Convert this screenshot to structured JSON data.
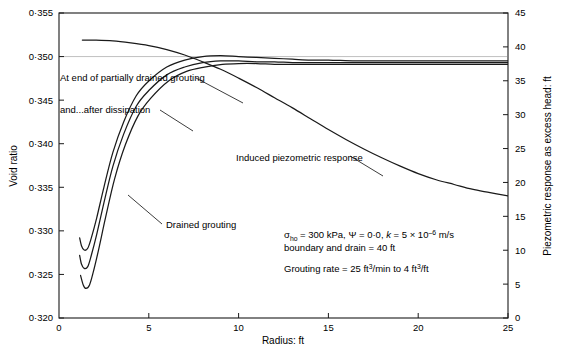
{
  "chart_data": {
    "type": "line",
    "title": "",
    "xlabel": "Radius: ft",
    "ylabel": "Void ratio",
    "y2label": "Piezometric response as excess head: ft",
    "xlim": [
      0,
      25
    ],
    "ylim": [
      0.32,
      0.355
    ],
    "y2lim": [
      0,
      45
    ],
    "grid": false,
    "legend": "none (curves labelled with leader lines)",
    "xticks": [
      "0",
      "5",
      "10",
      "15",
      "20",
      "25"
    ],
    "xtick_values": [
      0,
      5,
      10,
      15,
      20,
      25
    ],
    "yticks": [
      "0·320",
      "0·325",
      "0·330",
      "0·335",
      "0·340",
      "0·345",
      "0·350",
      "0·355"
    ],
    "ytick_values": [
      0.32,
      0.325,
      0.33,
      0.335,
      0.34,
      0.345,
      0.35,
      0.355
    ],
    "y2ticks": [
      "0",
      "5",
      "10",
      "15",
      "20",
      "25",
      "30",
      "35",
      "40",
      "45"
    ],
    "y2tick_values": [
      0,
      5,
      10,
      15,
      20,
      25,
      30,
      35,
      40,
      45
    ],
    "reference_line": {
      "axis": "y",
      "value": 0.35,
      "style": "faint grey horizontal"
    },
    "series": [
      {
        "name": "At end of partially drained grouting",
        "axis": "left",
        "x": [
          1.15,
          1.25,
          1.4,
          1.6,
          1.8,
          2.1,
          2.5,
          3.0,
          3.6,
          4.3,
          5.0,
          6.0,
          7.0,
          8.0,
          9.0,
          10.0,
          11.0,
          12.0,
          13.0,
          14.0,
          15.0,
          16.5,
          18.0,
          20.0,
          22.0,
          25.0
        ],
        "y": [
          0.3292,
          0.3283,
          0.3278,
          0.328,
          0.3292,
          0.3315,
          0.335,
          0.339,
          0.3425,
          0.3455,
          0.3472,
          0.3488,
          0.3496,
          0.35,
          0.3501,
          0.35,
          0.3499,
          0.3498,
          0.3497,
          0.3496,
          0.3496,
          0.3495,
          0.3495,
          0.3495,
          0.3495,
          0.3495
        ]
      },
      {
        "name": "and...after dissipation",
        "axis": "left",
        "x": [
          1.15,
          1.25,
          1.4,
          1.6,
          1.8,
          2.1,
          2.5,
          3.0,
          3.6,
          4.3,
          5.0,
          6.0,
          7.0,
          8.0,
          9.0,
          10.0,
          11.0,
          12.0,
          13.0,
          14.0,
          15.0,
          16.5,
          18.0,
          20.0,
          22.0,
          25.0
        ],
        "y": [
          0.3272,
          0.3262,
          0.3257,
          0.3259,
          0.3272,
          0.3296,
          0.3332,
          0.3374,
          0.3411,
          0.3443,
          0.3461,
          0.3479,
          0.3488,
          0.3493,
          0.3495,
          0.3495,
          0.3494,
          0.3494,
          0.3493,
          0.3493,
          0.3493,
          0.3493,
          0.3493,
          0.3493,
          0.3493,
          0.3493
        ]
      },
      {
        "name": "Drained grouting",
        "axis": "left",
        "x": [
          1.2,
          1.35,
          1.5,
          1.7,
          1.9,
          2.2,
          2.6,
          3.1,
          3.7,
          4.4,
          5.1,
          6.1,
          7.1,
          8.1,
          9.1,
          10.0,
          11.0,
          12.0,
          13.0,
          14.0,
          15.0,
          16.5,
          18.0,
          20.0,
          22.0,
          25.0
        ],
        "y": [
          0.3249,
          0.3238,
          0.3234,
          0.3238,
          0.3252,
          0.3278,
          0.3316,
          0.336,
          0.3399,
          0.3432,
          0.3452,
          0.3472,
          0.3483,
          0.3488,
          0.3491,
          0.3492,
          0.3492,
          0.3491,
          0.3491,
          0.3491,
          0.3491,
          0.3491,
          0.3491,
          0.3491,
          0.3491,
          0.3491
        ]
      },
      {
        "name": "Induced piezometric response",
        "axis": "right",
        "x": [
          1.3,
          2.0,
          3.0,
          4.0,
          5.0,
          6.0,
          7.0,
          8.0,
          9.0,
          10.0,
          11.0,
          12.0,
          13.0,
          14.0,
          15.0,
          16.0,
          17.0,
          18.0,
          19.0,
          20.0,
          21.0,
          22.0,
          23.0,
          24.0,
          25.0
        ],
        "y": [
          41.0,
          41.0,
          40.9,
          40.6,
          40.2,
          39.6,
          38.8,
          37.8,
          36.7,
          35.4,
          34.0,
          32.5,
          31.0,
          29.4,
          27.8,
          26.3,
          24.9,
          23.6,
          22.4,
          21.3,
          20.4,
          19.7,
          19.0,
          18.5,
          18.0
        ]
      }
    ],
    "annotations": [
      {
        "name": "partially-drained-label",
        "text": "At end of partially drained grouting",
        "x_px": 60,
        "y_px": 78
      },
      {
        "name": "after-dissipation-label",
        "text": "and...after dissipation",
        "x_px": 60,
        "y_px": 110
      },
      {
        "name": "drained-grouting-label",
        "text": "Drained grouting",
        "x_px": 165,
        "y_px": 225
      },
      {
        "name": "induced-piezometric-label",
        "text": "Induced piezometric response",
        "x_px": 236,
        "y_px": 158
      }
    ],
    "parameter_block": {
      "line1_parts": {
        "sigma": "σ",
        "sigma_sub": "ho",
        "after_sigma": " = 300 kPa, ",
        "psi": "Ψ",
        "psi_val": " = 0·0, ",
        "k": "k",
        "k_val": " = 5 × 10",
        "k_exp": "–6",
        "k_unit": " m/s"
      },
      "line2": "boundary and drain = 40 ft",
      "line3_parts": {
        "pre": "Grouting rate = 25 ft",
        "sup1": "3",
        "mid": "/min to 4 ft",
        "sup2": "3",
        "post": "/ft"
      },
      "line1_plain": "σho = 300 kPa, Ψ = 0·0, k = 5 × 10–6 m/s",
      "line3_plain": "Grouting rate = 25 ft3/min to 4 ft3/ft"
    },
    "colors": {
      "axis": "#1a1a1a",
      "curve": "#1a1a1a",
      "piezometric_curve": "#1a1a1a",
      "reference_line": "#b9b9b9",
      "background": "#ffffff"
    }
  }
}
